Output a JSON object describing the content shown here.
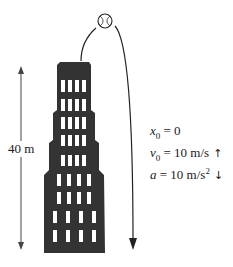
{
  "diagram": {
    "height_label": "40 m",
    "labels": {
      "x0": {
        "symbol": "x",
        "sub": "0",
        "eq": " = 0"
      },
      "v0": {
        "symbol": "v",
        "sub": "0",
        "eq": " = 10 m/s",
        "direction_icon": "↑"
      },
      "a": {
        "symbol": "a",
        "eq": " = 10 m/s",
        "sup": "2",
        "direction_icon": "↓"
      }
    },
    "colors": {
      "building": "#333333",
      "window": "#ffffff",
      "line": "#222222"
    }
  }
}
